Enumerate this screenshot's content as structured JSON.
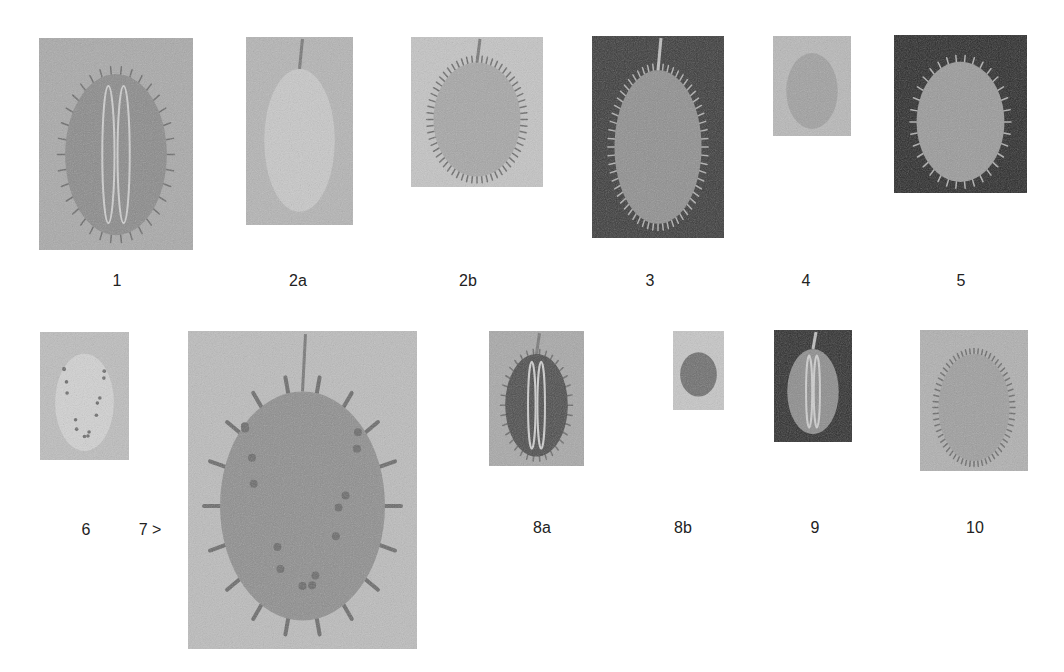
{
  "figure": {
    "row1": [
      {
        "label": "1",
        "tone": "mid",
        "bg": "#a9a9a9",
        "fruit": "#8a8a8a",
        "style": "spiny-ribbed",
        "box": [
          39,
          38,
          154,
          212
        ],
        "label_pos": [
          117,
          281
        ]
      },
      {
        "label": "2a",
        "tone": "light",
        "bg": "#b4b4b4",
        "fruit": "#c8c8c8",
        "style": "smooth",
        "box": [
          246,
          37,
          107,
          188
        ],
        "label_pos": [
          298,
          281
        ]
      },
      {
        "label": "2b",
        "tone": "light",
        "bg": "#c4c4c4",
        "fruit": "#a6a6a6",
        "style": "hairy",
        "box": [
          411,
          37,
          132,
          150
        ],
        "label_pos": [
          468,
          281
        ]
      },
      {
        "label": "3",
        "tone": "dark",
        "bg": "#3a3a3a",
        "fruit": "#8f8f8f",
        "style": "hairy",
        "box": [
          592,
          36,
          132,
          202
        ],
        "label_pos": [
          650,
          281
        ]
      },
      {
        "label": "4",
        "tone": "light",
        "bg": "#b8b8b8",
        "fruit": "#a0a0a0",
        "style": "smooth",
        "box": [
          773,
          36,
          78,
          100
        ],
        "label_pos": [
          806,
          281
        ]
      },
      {
        "label": "5",
        "tone": "dark",
        "bg": "#2a2a2a",
        "fruit": "#9a9a9a",
        "style": "spiny",
        "box": [
          894,
          35,
          133,
          158
        ],
        "label_pos": [
          961,
          281
        ]
      }
    ],
    "row2": [
      {
        "label": "6",
        "tone": "light",
        "bg": "#bdbdbd",
        "fruit": "#d2d2d2",
        "style": "speckled",
        "box": [
          40,
          332,
          89,
          128
        ],
        "label_pos": [
          86,
          530
        ]
      },
      {
        "label": "7 >",
        "tone": "light",
        "bg": "#bcbcbc",
        "fruit": "#8e8e8e",
        "style": "horned",
        "box": [
          188,
          331,
          229,
          318
        ],
        "label_pos": [
          150,
          530
        ]
      },
      {
        "label": "8a",
        "tone": "mid",
        "bg": "#a8a8a8",
        "fruit": "#4c4c4c",
        "style": "spiny-dark",
        "box": [
          489,
          331,
          95,
          135
        ],
        "label_pos": [
          542,
          528
        ]
      },
      {
        "label": "8b",
        "tone": "light",
        "bg": "#c6c6c6",
        "fruit": "#6e6e6e",
        "style": "round",
        "box": [
          673,
          331,
          51,
          79
        ],
        "label_pos": [
          683,
          528
        ]
      },
      {
        "label": "9",
        "tone": "dark",
        "bg": "#2e2e2e",
        "fruit": "#8c8c8c",
        "style": "ribbed",
        "box": [
          774,
          330,
          78,
          112
        ],
        "label_pos": [
          815,
          528
        ]
      },
      {
        "label": "10",
        "tone": "mid",
        "bg": "#b0b0b0",
        "fruit": "#9e9e9e",
        "style": "hairy",
        "box": [
          920,
          330,
          108,
          141
        ],
        "label_pos": [
          975,
          528
        ]
      }
    ]
  }
}
